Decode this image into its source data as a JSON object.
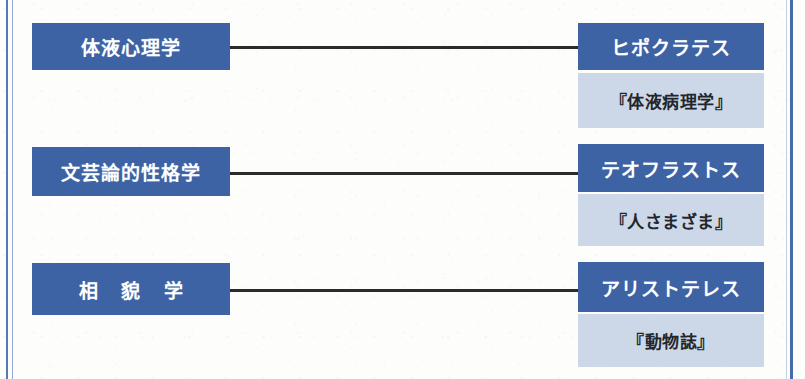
{
  "figure": {
    "type": "relationship-diagram",
    "orientation": "left-to-right",
    "colors": {
      "primary_box": "#3d63a5",
      "primary_text": "#ffffff",
      "work_box": "#ccd8e8",
      "work_text": "#22262c",
      "connector_line": "#2b2b2b",
      "frame_rule": "#4a6fad",
      "background": "#fdfdfc"
    },
    "rows": [
      {
        "discipline": "体液心理学",
        "philosopher": "ヒポクラテス",
        "work": "『体液病理学』",
        "connector": "horizontal-line"
      },
      {
        "discipline": "文芸論的性格学",
        "philosopher": "テオフラストス",
        "work": "『人さまざま』",
        "connector": "horizontal-line"
      },
      {
        "discipline": "相 貌 学",
        "philosopher": "アリストテレス",
        "work": "『動物誌』",
        "connector": "horizontal-line"
      }
    ]
  }
}
